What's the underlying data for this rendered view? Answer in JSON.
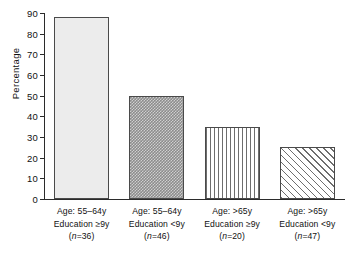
{
  "chart_data": {
    "type": "bar",
    "title": "",
    "subtitle": "",
    "xlabel": "",
    "ylabel": "Percentage",
    "ylim": [
      0,
      90
    ],
    "grid": false,
    "legend": "none",
    "y_ticks": [
      "0",
      "10",
      "20",
      "30",
      "40",
      "50",
      "60",
      "70",
      "80",
      "90"
    ],
    "y_tick_values": [
      0,
      10,
      20,
      30,
      40,
      50,
      60,
      70,
      80,
      90
    ],
    "categories": [
      "Age: 55-64y Education ≥9y (n=36)",
      "Age: 55-64y Education <9y (n=46)",
      "Age: >65y Education ≥9y (n=20)",
      "Age: >65y Education <9y (n=47)"
    ],
    "values": [
      88,
      50,
      35,
      25
    ],
    "bars": [
      {
        "value": 88,
        "pattern": "fine-dots",
        "fill_color": "#ececec",
        "edge_color": "#4a4a4a",
        "line1": "Age: 55–64y",
        "line2": "Education ≥9y",
        "n_prefix": "(",
        "n_italic": "n",
        "n_suffix": "=36)"
      },
      {
        "value": 50,
        "pattern": "dense-checker",
        "fill_color": "#8c8c8c",
        "edge_color": "#4a4a4a",
        "line1": "Age: 55–64y",
        "line2": "Education <9y",
        "n_prefix": "(",
        "n_italic": "n",
        "n_suffix": "=46)"
      },
      {
        "value": 35,
        "pattern": "vertical-stripes",
        "fill_color": "#ffffff",
        "edge_color": "#4a4a4a",
        "line1": "Age: >65y",
        "line2": "Education ≥9y",
        "n_prefix": "(",
        "n_italic": "n",
        "n_suffix": "=20)"
      },
      {
        "value": 25,
        "pattern": "diagonal-hatch",
        "fill_color": "#ffffff",
        "edge_color": "#4a4a4a",
        "line1": "Age: >65y",
        "line2": "Education <9y",
        "n_prefix": "(",
        "n_italic": "n",
        "n_suffix": "=47)"
      }
    ]
  }
}
